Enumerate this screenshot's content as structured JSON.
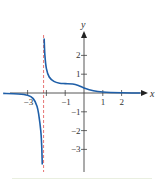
{
  "chart_data": {
    "type": "line",
    "title": "",
    "xlabel": "x",
    "ylabel": "y",
    "xlim": [
      -4.3,
      3.1
    ],
    "ylim": [
      -3.9,
      3.0
    ],
    "grid": false,
    "legend": null,
    "x_ticks": [
      -3,
      -2,
      -1,
      1,
      2
    ],
    "x_tick_labels": [
      "−3",
      "",
      "−1",
      "1",
      "2"
    ],
    "y_ticks": [
      -3,
      -2,
      -1,
      1,
      2
    ],
    "y_tick_labels": [
      "−3",
      "−2",
      "−1",
      "1",
      "2"
    ],
    "vertical_asymptote": {
      "x": -2.15,
      "style": "dashed",
      "color": "#e0524f"
    },
    "horizontal_asymptote": {
      "y": 0
    },
    "series": [
      {
        "name": "left branch",
        "color": "#1f5fa8",
        "points": [
          [
            -4.3,
            -0.02
          ],
          [
            -3.5,
            -0.05
          ],
          [
            -3.0,
            -0.12
          ],
          [
            -2.7,
            -0.3
          ],
          [
            -2.5,
            -0.7
          ],
          [
            -2.4,
            -1.2
          ],
          [
            -2.3,
            -2.0
          ],
          [
            -2.25,
            -2.8
          ],
          [
            -2.22,
            -3.8
          ]
        ]
      },
      {
        "name": "right branch",
        "color": "#1f5fa8",
        "points": [
          [
            -2.12,
            2.9
          ],
          [
            -2.08,
            2.0
          ],
          [
            -2.0,
            1.3
          ],
          [
            -1.85,
            0.85
          ],
          [
            -1.6,
            0.62
          ],
          [
            -1.3,
            0.52
          ],
          [
            -1.0,
            0.5
          ],
          [
            -0.6,
            0.48
          ],
          [
            -0.3,
            0.4
          ],
          [
            0.0,
            0.27
          ],
          [
            0.5,
            0.12
          ],
          [
            1.0,
            0.05
          ],
          [
            2.0,
            0.01
          ],
          [
            3.0,
            0.0
          ]
        ]
      }
    ]
  },
  "axes": {
    "x_label": "x",
    "y_label": "y"
  }
}
